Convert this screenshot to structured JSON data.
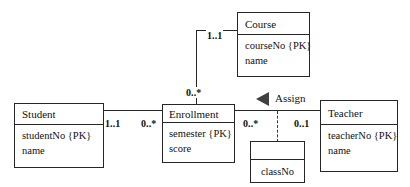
{
  "diagram": {
    "classes": [
      {
        "id": "course",
        "name": "Course",
        "attributes": [
          "courseNo {PK}",
          "name"
        ]
      },
      {
        "id": "student",
        "name": "Student",
        "attributes": [
          "studentNo {PK}",
          "name"
        ]
      },
      {
        "id": "enrollment",
        "name": "Enrollment",
        "attributes": [
          "semester {PK}",
          "score"
        ]
      },
      {
        "id": "teacher",
        "name": "Teacher",
        "attributes": [
          "teacherNo {PK}",
          "name"
        ]
      },
      {
        "id": "classno",
        "name": "",
        "attributes": [
          "classNo"
        ]
      }
    ],
    "multiplicities": {
      "student_end": "1..1",
      "enrollment_student_end": "0..*",
      "course_end": "1..1",
      "enrollment_course_end": "0..*",
      "enrollment_teacher_end": "0..*",
      "teacher_end": "0..1"
    },
    "association_name": "Assign",
    "colors": {
      "stroke": "#262626",
      "fill": "#ffffff",
      "text": "#111111",
      "arrow": "#404040",
      "background": "#ffffff"
    }
  }
}
